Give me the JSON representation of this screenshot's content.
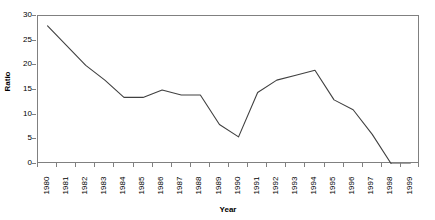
{
  "chart_data": {
    "type": "line",
    "title": "",
    "xlabel": "Year",
    "ylabel": "Ratio",
    "categories": [
      "1980",
      "1981",
      "1982",
      "1983",
      "1984",
      "1985",
      "1986",
      "1987",
      "1988",
      "1989",
      "1990",
      "1991",
      "1992",
      "1993",
      "1994",
      "1995",
      "1996",
      "1997",
      "1998",
      "1999"
    ],
    "values": [
      28.0,
      24.0,
      20.0,
      17.0,
      13.5,
      13.5,
      15.0,
      14.0,
      14.0,
      8.0,
      5.5,
      14.5,
      17.0,
      18.0,
      19.0,
      13.0,
      11.0,
      6.0,
      0.0,
      0.0
    ],
    "series": [
      {
        "name": "Ratio",
        "values": [
          28.0,
          24.0,
          20.0,
          17.0,
          13.5,
          13.5,
          15.0,
          14.0,
          14.0,
          8.0,
          5.5,
          14.5,
          17.0,
          18.0,
          19.0,
          13.0,
          11.0,
          6.0,
          0.0,
          0.0
        ],
        "color": "#404040"
      }
    ],
    "ylim": [
      0,
      30
    ],
    "yticks": [
      0,
      5,
      10,
      15,
      20,
      25,
      30
    ],
    "ytick_labels": [
      "0",
      "5",
      "10",
      "15",
      "20",
      "25",
      "30"
    ],
    "grid": false,
    "legend": false,
    "legend_position": "none",
    "line_color": "#404040",
    "axis_color": "#808080",
    "background": "#ffffff"
  }
}
